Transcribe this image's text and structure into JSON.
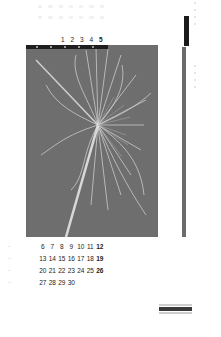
{
  "calendar": {
    "top_row_days": [
      "1",
      "2",
      "3",
      "4",
      "5"
    ],
    "top_row_bold_index": 4,
    "weeks": [
      {
        "marker": "–",
        "days": [
          "6",
          "7",
          "8",
          "9",
          "10",
          "11",
          "12"
        ]
      },
      {
        "marker": "–",
        "days": [
          "13",
          "14",
          "15",
          "16",
          "17",
          "18",
          "19"
        ]
      },
      {
        "marker": "–",
        "days": [
          "20",
          "21",
          "22",
          "23",
          "24",
          "25",
          "26"
        ]
      },
      {
        "marker": "–",
        "days": [
          "27",
          "28",
          "29",
          "30",
          "",
          "",
          ""
        ]
      }
    ],
    "bold_day_index": 6
  },
  "photo": {
    "description": "black-and-white photograph of a frayed palm frond / fan on a stick against gray background",
    "background_color": "#6e6e6e"
  },
  "colors": {
    "side_dark": "#1a1a1a",
    "side_bar": "#6b6b6b",
    "text": "#222222"
  }
}
